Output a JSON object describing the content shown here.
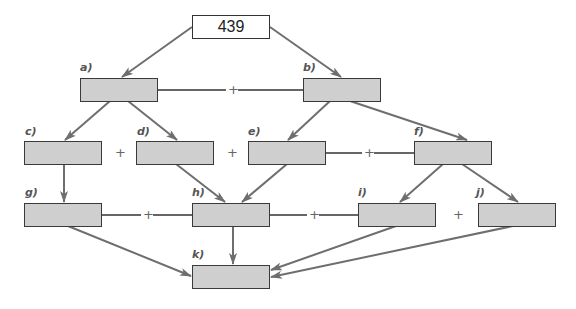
{
  "diagram": {
    "root": {
      "value": "439"
    },
    "nodes": [
      {
        "id": "a",
        "label": "a)",
        "value": ""
      },
      {
        "id": "b",
        "label": "b)",
        "value": ""
      },
      {
        "id": "c",
        "label": "c)",
        "value": ""
      },
      {
        "id": "d",
        "label": "d)",
        "value": ""
      },
      {
        "id": "e",
        "label": "e)",
        "value": ""
      },
      {
        "id": "f",
        "label": "f)",
        "value": ""
      },
      {
        "id": "g",
        "label": "g)",
        "value": ""
      },
      {
        "id": "h",
        "label": "h)",
        "value": ""
      },
      {
        "id": "i",
        "label": "i)",
        "value": ""
      },
      {
        "id": "j",
        "label": "j)",
        "value": ""
      },
      {
        "id": "k",
        "label": "k)",
        "value": ""
      }
    ],
    "operators": {
      "ab": "+",
      "cd": "+",
      "de": "+",
      "ef": "+",
      "gh": "+",
      "hi": "+",
      "ij": "+"
    },
    "edges": [
      [
        "root",
        "a"
      ],
      [
        "root",
        "b"
      ],
      [
        "a",
        "c"
      ],
      [
        "a",
        "d"
      ],
      [
        "b",
        "e"
      ],
      [
        "b",
        "f"
      ],
      [
        "c",
        "g"
      ],
      [
        "d",
        "h"
      ],
      [
        "e",
        "h"
      ],
      [
        "f",
        "i"
      ],
      [
        "f",
        "j"
      ],
      [
        "g",
        "k"
      ],
      [
        "h",
        "k"
      ],
      [
        "i",
        "k"
      ],
      [
        "j",
        "k"
      ]
    ],
    "colors": {
      "box_fill": "#cfcfcf",
      "border": "#3a3a3a",
      "arrow": "#6e6e6e",
      "label": "#555555"
    }
  }
}
